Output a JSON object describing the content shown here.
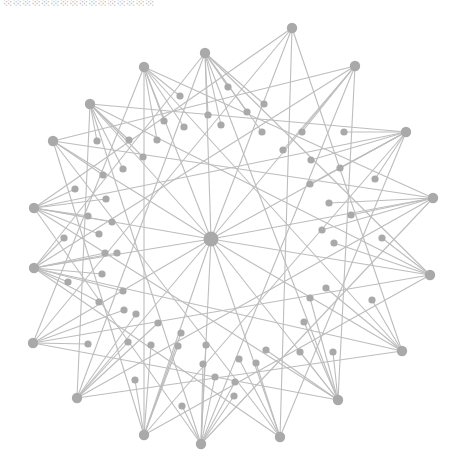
{
  "title_clipped": "░░░░░░░░░░░░░░░░",
  "colors": {
    "node": "#a9a9a9",
    "edge": "#bdbdbd",
    "background": "#ffffff"
  },
  "graph": {
    "hub": {
      "x": 211,
      "y": 239,
      "r": 7.5
    },
    "outer": [
      [
        205,
        53
      ],
      [
        292,
        28
      ],
      [
        355,
        66
      ],
      [
        406,
        132
      ],
      [
        433,
        198
      ],
      [
        430,
        275
      ],
      [
        402,
        351
      ],
      [
        338,
        400
      ],
      [
        280,
        437
      ],
      [
        201,
        444
      ],
      [
        144,
        435
      ],
      [
        77,
        398
      ],
      [
        33,
        343
      ],
      [
        34,
        268
      ],
      [
        34,
        208
      ],
      [
        53,
        141
      ],
      [
        90,
        104
      ],
      [
        144,
        67
      ]
    ],
    "mid": [
      [
        180,
        96
      ],
      [
        228,
        87
      ],
      [
        264,
        104
      ],
      [
        164,
        121
      ],
      [
        184,
        127
      ],
      [
        208,
        115
      ],
      [
        221,
        125
      ],
      [
        247,
        112
      ],
      [
        262,
        132
      ],
      [
        283,
        150
      ],
      [
        302,
        132
      ],
      [
        344,
        132
      ],
      [
        311,
        160
      ],
      [
        340,
        168
      ],
      [
        310,
        184
      ],
      [
        375,
        179
      ],
      [
        329,
        203
      ],
      [
        351,
        215
      ],
      [
        322,
        230
      ],
      [
        334,
        243
      ],
      [
        382,
        238
      ],
      [
        326,
        288
      ],
      [
        310,
        298
      ],
      [
        372,
        300
      ],
      [
        304,
        322
      ],
      [
        333,
        352
      ],
      [
        300,
        352
      ],
      [
        266,
        350
      ],
      [
        239,
        359
      ],
      [
        256,
        363
      ],
      [
        235,
        382
      ],
      [
        234,
        396
      ],
      [
        215,
        377
      ],
      [
        203,
        364
      ],
      [
        206,
        345
      ],
      [
        182,
        406
      ],
      [
        135,
        380
      ],
      [
        178,
        346
      ],
      [
        151,
        345
      ],
      [
        128,
        342
      ],
      [
        88,
        344
      ],
      [
        181,
        333
      ],
      [
        158,
        323
      ],
      [
        136,
        314
      ],
      [
        124,
        310
      ],
      [
        99,
        302
      ],
      [
        123,
        291
      ],
      [
        102,
        274
      ],
      [
        68,
        282
      ],
      [
        105,
        253
      ],
      [
        117,
        253
      ],
      [
        64,
        238
      ],
      [
        99,
        234
      ],
      [
        88,
        216
      ],
      [
        112,
        222
      ],
      [
        106,
        199
      ],
      [
        75,
        189
      ],
      [
        103,
        175
      ],
      [
        123,
        169
      ],
      [
        143,
        157
      ],
      [
        157,
        140
      ],
      [
        129,
        140
      ],
      [
        97,
        141
      ]
    ]
  }
}
